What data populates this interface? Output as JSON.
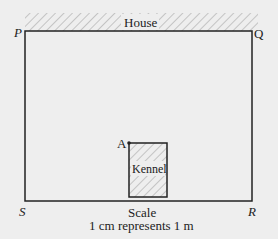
{
  "diagram": {
    "house_label": "House",
    "kennel_label": "Kennel",
    "vertices": {
      "P": "P",
      "Q": "Q",
      "R": "R",
      "S": "S",
      "A": "A"
    },
    "scale_title": "Scale",
    "scale_text": "1 cm represents 1 m",
    "colors": {
      "background": "#eeeeee",
      "line": "#222222",
      "hatch": "#999999"
    }
  }
}
